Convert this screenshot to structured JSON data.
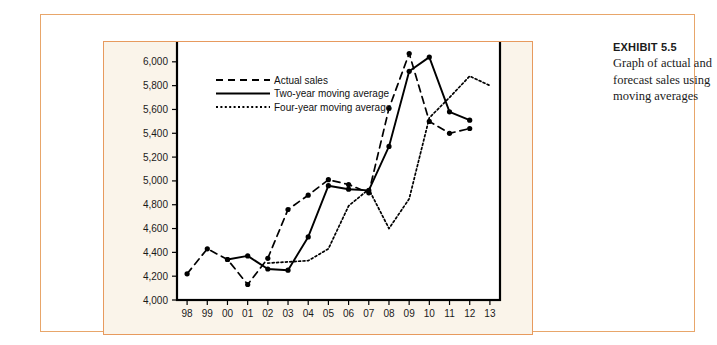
{
  "exhibit": {
    "title": "EXHIBIT 5.5",
    "description": "Graph of actual and forecast sales using moving averages"
  },
  "colors": {
    "frame_border": "#e8a66a",
    "panel_border": "#e79a5e",
    "panel_background": "#faf4ea",
    "exhibit_top": "#e8995c",
    "exhibit_bottom": "#ffffff",
    "line": "#000000",
    "axis": "#000000"
  },
  "chart_data": {
    "type": "line",
    "title": "",
    "xlabel": "",
    "ylabel": "",
    "ylim": [
      4000,
      6200
    ],
    "xlim": [
      "98",
      "13"
    ],
    "grid": false,
    "legend_position": "top-left",
    "ytick_labels": [
      "4,000",
      "4,200",
      "4,400",
      "4,600",
      "4,800",
      "5,000",
      "5,200",
      "5,400",
      "5,600",
      "5,800",
      "6,000"
    ],
    "ytick_values": [
      4000,
      4200,
      4400,
      4600,
      4800,
      5000,
      5200,
      5400,
      5600,
      5800,
      6000
    ],
    "categories": [
      "98",
      "99",
      "00",
      "01",
      "02",
      "03",
      "04",
      "05",
      "06",
      "07",
      "08",
      "09",
      "10",
      "11",
      "12",
      "13"
    ],
    "series": [
      {
        "name": "Actual sales",
        "style": "dashed",
        "markers": true,
        "values": [
          4220,
          4430,
          4340,
          4130,
          4350,
          4760,
          4880,
          5010,
          4970,
          4900,
          5610,
          6070,
          5500,
          5400,
          5440,
          null
        ]
      },
      {
        "name": "Two-year moving average",
        "style": "solid",
        "markers": true,
        "values": [
          null,
          null,
          4340,
          4370,
          4260,
          4250,
          4530,
          4960,
          4930,
          4920,
          5290,
          5920,
          6040,
          5580,
          5510,
          null
        ]
      },
      {
        "name": "Four-year moving average",
        "style": "dotted",
        "markers": false,
        "values": [
          null,
          null,
          null,
          null,
          4310,
          4320,
          4330,
          4430,
          4790,
          4930,
          4600,
          4850,
          5530,
          5700,
          5880,
          5800
        ]
      }
    ],
    "legend": [
      {
        "label": "Actual sales",
        "style": "dashed"
      },
      {
        "label": "Two-year moving average",
        "style": "solid"
      },
      {
        "label": "Four-year moving average",
        "style": "dotted"
      }
    ]
  }
}
